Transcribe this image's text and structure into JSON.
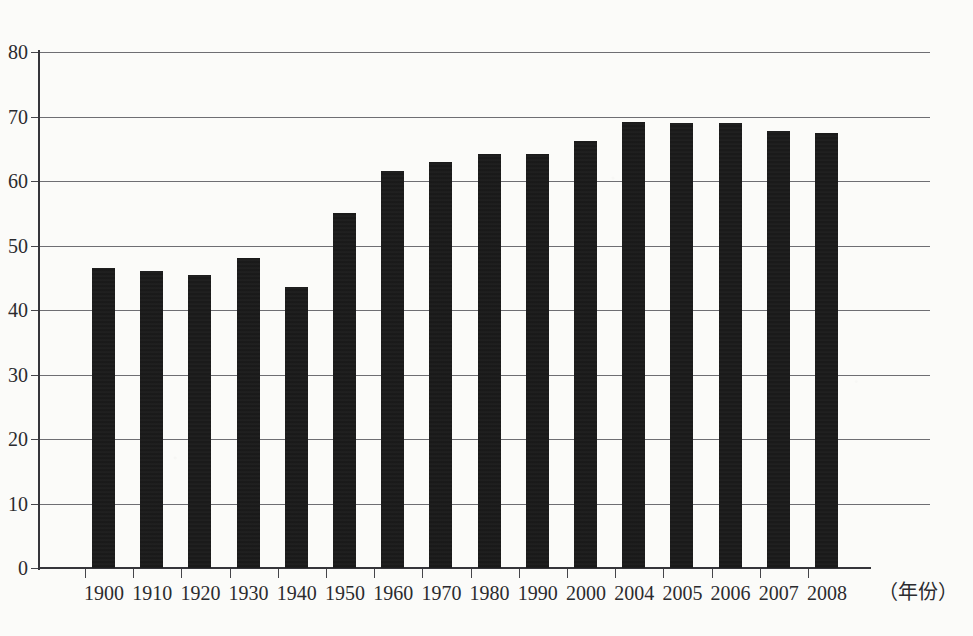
{
  "chart_data": {
    "type": "bar",
    "title": "",
    "xlabel": "（年份）",
    "ylabel": "",
    "ylim": [
      0,
      80
    ],
    "yticks": [
      0,
      10,
      20,
      30,
      40,
      50,
      60,
      70,
      80
    ],
    "grid": true,
    "legend": null,
    "categories": [
      "1900",
      "1910",
      "1920",
      "1930",
      "1940",
      "1950",
      "1960",
      "1970",
      "1980",
      "1990",
      "2000",
      "2004",
      "2005",
      "2006",
      "2007",
      "2008"
    ],
    "values": [
      46.5,
      46.0,
      45.5,
      48.0,
      43.5,
      55.0,
      61.5,
      63.0,
      64.2,
      64.2,
      66.2,
      69.2,
      69.0,
      69.0,
      67.8,
      67.5
    ],
    "series": [
      {
        "name": "",
        "values": [
          46.5,
          46.0,
          45.5,
          48.0,
          43.5,
          55.0,
          61.5,
          63.0,
          64.2,
          64.2,
          66.2,
          69.2,
          69.0,
          69.0,
          67.8,
          67.5
        ]
      }
    ],
    "bar_color": "#171717",
    "background_color": "#fbfbf9",
    "axis_color": "#35353a",
    "gridline_color": "#6e6e73"
  }
}
